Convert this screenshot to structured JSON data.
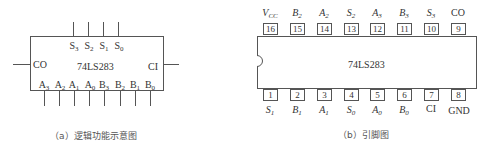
{
  "left_diagram": {
    "chip_name": "74LS283",
    "top_pins": [
      {
        "name": "S",
        "sub": "3"
      },
      {
        "name": "S",
        "sub": "2"
      },
      {
        "name": "S",
        "sub": "1"
      },
      {
        "name": "S",
        "sub": "0"
      }
    ],
    "left_pin": "CO",
    "right_pin": "CI",
    "bottom_pins": [
      {
        "name": "A",
        "sub": "3"
      },
      {
        "name": "A",
        "sub": "2"
      },
      {
        "name": "A",
        "sub": "1"
      },
      {
        "name": "A",
        "sub": "0"
      },
      {
        "name": "B",
        "sub": "3"
      },
      {
        "name": "B",
        "sub": "2"
      },
      {
        "name": "B",
        "sub": "1"
      },
      {
        "name": "B",
        "sub": "0"
      }
    ],
    "caption": "（a）逻辑功能示意图"
  },
  "right_diagram": {
    "chip_name": "74LS283",
    "top_row": [
      {
        "num": "16",
        "name": "V",
        "sub": "CC"
      },
      {
        "num": "15",
        "name": "B",
        "sub": "2"
      },
      {
        "num": "14",
        "name": "A",
        "sub": "2"
      },
      {
        "num": "13",
        "name": "S",
        "sub": "2"
      },
      {
        "num": "12",
        "name": "A",
        "sub": "3"
      },
      {
        "num": "11",
        "name": "B",
        "sub": "3"
      },
      {
        "num": "10",
        "name": "S",
        "sub": "3"
      },
      {
        "num": "9",
        "name": "CO",
        "sub": ""
      }
    ],
    "bottom_row": [
      {
        "num": "1",
        "name": "S",
        "sub": "1"
      },
      {
        "num": "2",
        "name": "B",
        "sub": "1"
      },
      {
        "num": "3",
        "name": "A",
        "sub": "1"
      },
      {
        "num": "4",
        "name": "S",
        "sub": "0"
      },
      {
        "num": "5",
        "name": "A",
        "sub": "0"
      },
      {
        "num": "6",
        "name": "B",
        "sub": "0"
      },
      {
        "num": "7",
        "name": "CI",
        "sub": ""
      },
      {
        "num": "8",
        "name": "GND",
        "sub": ""
      }
    ],
    "caption": "（b）引脚图"
  }
}
